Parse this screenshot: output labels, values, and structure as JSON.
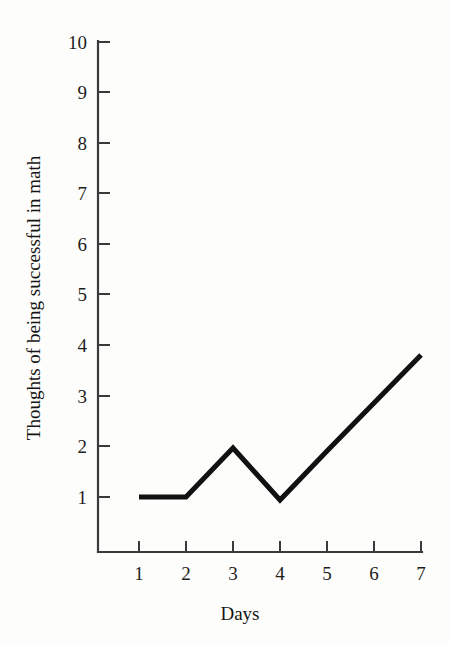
{
  "chart_data": {
    "type": "line",
    "title": "",
    "xlabel": "Days",
    "ylabel": "Thoughts of being successful in math",
    "x": [
      1,
      2,
      3,
      4,
      5,
      6,
      7
    ],
    "values": [
      1.0,
      1.0,
      1.97,
      0.94,
      1.91,
      2.86,
      3.81
    ],
    "series": [
      {
        "name": "Thoughts of being successful in math",
        "values": [
          1.0,
          1.0,
          1.97,
          0.94,
          1.91,
          2.86,
          3.81
        ]
      }
    ],
    "xlim": [
      0.5,
      7.0
    ],
    "ylim": [
      0.0,
      10.0
    ],
    "xticks": [
      1,
      2,
      3,
      4,
      5,
      6,
      7
    ],
    "yticks": [
      1,
      2,
      3,
      4,
      5,
      6,
      7,
      8,
      9,
      10
    ],
    "xtick_labels": [
      "1",
      "2",
      "3",
      "4",
      "5",
      "6",
      "7"
    ],
    "ytick_labels": [
      "1",
      "2",
      "3",
      "4",
      "5",
      "6",
      "7",
      "8",
      "9",
      "10"
    ],
    "grid": false,
    "legend": false,
    "legend_position": "none",
    "line_color": "#111111",
    "axis_color": "#3a3a3a",
    "background_color": "#fdfdfb",
    "tick_direction": "in",
    "markers": false
  }
}
